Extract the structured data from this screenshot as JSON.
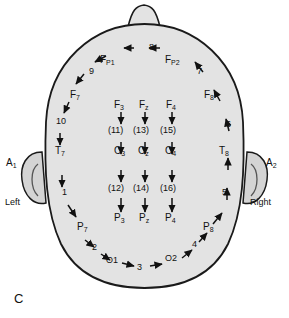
{
  "figure": {
    "panel_label": "C",
    "type": "eeg-electrode-placement-head-diagram-top-view"
  },
  "orientation": {
    "left_label": "Left",
    "right_label": "Right"
  },
  "ears": {
    "left": "A1",
    "right": "A2"
  },
  "electrodes": {
    "frontopolar": [
      {
        "id": "fp1",
        "label": "FP1",
        "sub": "P1",
        "base": "F"
      },
      {
        "id": "fp2",
        "label": "FP2",
        "sub": "P2",
        "base": "F"
      }
    ],
    "frontal": [
      {
        "id": "f7",
        "base": "F",
        "sub": "7"
      },
      {
        "id": "f3",
        "base": "F",
        "sub": "3"
      },
      {
        "id": "fz",
        "base": "F",
        "sub": "z"
      },
      {
        "id": "f4",
        "base": "F",
        "sub": "4"
      },
      {
        "id": "f8",
        "base": "F",
        "sub": "8"
      }
    ],
    "central": [
      {
        "id": "t7",
        "base": "T",
        "sub": "7"
      },
      {
        "id": "c3",
        "base": "C",
        "sub": "3"
      },
      {
        "id": "cz",
        "base": "C",
        "sub": "z"
      },
      {
        "id": "c4",
        "base": "C",
        "sub": "4"
      },
      {
        "id": "t8",
        "base": "T",
        "sub": "8"
      }
    ],
    "parietal": [
      {
        "id": "p7",
        "base": "P",
        "sub": "7"
      },
      {
        "id": "p3",
        "base": "P",
        "sub": "3"
      },
      {
        "id": "pz",
        "base": "P",
        "sub": "z"
      },
      {
        "id": "p4",
        "base": "P",
        "sub": "4"
      },
      {
        "id": "p8",
        "base": "P",
        "sub": "8"
      }
    ],
    "occipital": [
      {
        "id": "o1",
        "label": "O1"
      },
      {
        "id": "o2",
        "label": "O2"
      }
    ]
  },
  "sequence_numbers": {
    "outer_ring": [
      "1",
      "2",
      "3",
      "4",
      "5",
      "6",
      "7",
      "8",
      "9",
      "10"
    ],
    "inner_parenthesized": [
      "(11)",
      "(12)",
      "(13)",
      "(14)",
      "(15)",
      "(16)"
    ]
  },
  "markers": {
    "n1": "1",
    "n2": "2",
    "n3": "3",
    "n4": "4",
    "n5": "5",
    "n6": "6",
    "n7": "7",
    "n8": "8",
    "n9": "9",
    "n10": "10",
    "p11": "(11)",
    "p12": "(12)",
    "p13": "(13)",
    "p14": "(14)",
    "p15": "(15)",
    "p16": "(16)"
  },
  "colors": {
    "head_fill": "#e3e3e3",
    "head_stroke": "#1a1a1a",
    "ear_fill": "#d4d4d4",
    "text": "#111111",
    "background": "#ffffff"
  }
}
